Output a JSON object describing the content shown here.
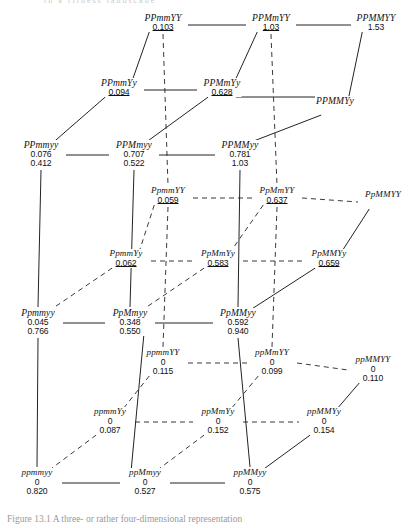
{
  "figure": {
    "caption_top": "in  a  fitness  landscape",
    "caption_bottom": "Figure  13.1     A  three-  or  rather  four-dimensional  representation"
  },
  "chart_data": {
    "type": "diagram",
    "value_label_note": "First number is the upper (underlined) value; second number, when present, is the lower value.",
    "nodes": [
      {
        "id": "PPmmYY",
        "label": "PPmmYY",
        "v1": "0.103",
        "v2": "",
        "underline": true,
        "x": 163,
        "y": 13
      },
      {
        "id": "PPMmYY",
        "label": "PPMmYY",
        "v1": "1.03",
        "v2": "",
        "underline": true,
        "x": 271,
        "y": 13
      },
      {
        "id": "PPMMYY",
        "label": "PPMMYY",
        "v1": "1.53",
        "v2": "",
        "underline": false,
        "x": 376,
        "y": 13
      },
      {
        "id": "PPmmYy",
        "label": "PPmmYy",
        "v1": "0.094",
        "v2": "",
        "underline": true,
        "x": 119,
        "y": 78
      },
      {
        "id": "PPMmYy",
        "label": "PPMmYy",
        "v1": "0.628",
        "v2": "",
        "underline": true,
        "x": 222,
        "y": 78
      },
      {
        "id": "PPMMYy",
        "label": "PPMMYy",
        "v1": "",
        "v2": "",
        "underline": false,
        "x": 335,
        "y": 96
      },
      {
        "id": "PPmmyy",
        "label": "PPmmyy",
        "v1": "0.076",
        "v2": "0.412",
        "underline": false,
        "x": 41,
        "y": 140
      },
      {
        "id": "PPMmyy",
        "label": "PPMmyy",
        "v1": "0.707",
        "v2": "0.522",
        "underline": false,
        "x": 134,
        "y": 140
      },
      {
        "id": "PPMMyy",
        "label": "PPMMyy",
        "v1": "0.781",
        "v2": "1.03",
        "underline": false,
        "x": 240,
        "y": 140
      },
      {
        "id": "PpmmYY",
        "label": "PpmmYY",
        "v1": "0.059",
        "v2": "",
        "underline": true,
        "x": 168,
        "y": 186
      },
      {
        "id": "PpMmYY",
        "label": "PpMmYY",
        "v1": "0.637",
        "v2": "",
        "underline": true,
        "x": 277,
        "y": 186
      },
      {
        "id": "PpMMYY",
        "label": "PpMMYY",
        "v1": "",
        "v2": "",
        "underline": false,
        "x": 383,
        "y": 190
      },
      {
        "id": "PpmmYy",
        "label": "PpmmYy",
        "v1": "0.062",
        "v2": "",
        "underline": true,
        "x": 126,
        "y": 249
      },
      {
        "id": "PpMmYy",
        "label": "PpMmYy",
        "v1": "0.583",
        "v2": "",
        "underline": true,
        "x": 218,
        "y": 249
      },
      {
        "id": "PpMMYy",
        "label": "PpMMYy",
        "v1": "0.659",
        "v2": "",
        "underline": true,
        "x": 329,
        "y": 249
      },
      {
        "id": "Ppmmyy",
        "label": "Ppmmyy",
        "v1": "0.045",
        "v2": "0.766",
        "underline": false,
        "x": 38,
        "y": 308
      },
      {
        "id": "PpMmyy",
        "label": "PpMmyy",
        "v1": "0.348",
        "v2": "0.550",
        "underline": false,
        "x": 130,
        "y": 308
      },
      {
        "id": "PpMMyy",
        "label": "PpMMyy",
        "v1": "0.592",
        "v2": "0.940",
        "underline": false,
        "x": 238,
        "y": 308
      },
      {
        "id": "ppmmYY",
        "label": "ppmmYY",
        "v1": "0",
        "v2": "0.115",
        "underline": false,
        "x": 163,
        "y": 348
      },
      {
        "id": "ppMmYY",
        "label": "ppMmYY",
        "v1": "0",
        "v2": "0.099",
        "underline": false,
        "x": 272,
        "y": 348
      },
      {
        "id": "ppMMYY",
        "label": "ppMMYY",
        "v1": "0",
        "v2": "0.110",
        "underline": false,
        "x": 373,
        "y": 355
      },
      {
        "id": "ppmmYy",
        "label": "ppmmYy",
        "v1": "0",
        "v2": "0.087",
        "underline": false,
        "x": 110,
        "y": 407
      },
      {
        "id": "ppMmYy",
        "label": "ppMmYy",
        "v1": "0",
        "v2": "0.152",
        "underline": false,
        "x": 218,
        "y": 407
      },
      {
        "id": "ppMMYy",
        "label": "ppMMYy",
        "v1": "0",
        "v2": "0.154",
        "underline": false,
        "x": 324,
        "y": 407
      },
      {
        "id": "ppmmyy",
        "label": "ppmmyy",
        "v1": "0",
        "v2": "0.820",
        "underline": false,
        "x": 37,
        "y": 468
      },
      {
        "id": "ppMmyy",
        "label": "ppMmyy",
        "v1": "0",
        "v2": "0.527",
        "underline": false,
        "x": 145,
        "y": 468
      },
      {
        "id": "ppMMyy",
        "label": "ppMMyy",
        "v1": "0",
        "v2": "0.575",
        "underline": false,
        "x": 250,
        "y": 468
      }
    ],
    "edges_solid": [
      [
        "PPmmYY",
        "PPMmYY"
      ],
      [
        "PPMmYY",
        "PPMMYY"
      ],
      [
        "PPmmYy",
        "PPMmYy"
      ],
      [
        "PPMmYy",
        "PPMMYy"
      ],
      [
        "PPmmyy",
        "PPMmyy"
      ],
      [
        "PPMmyy",
        "PPMMyy"
      ],
      [
        "PPmmYY",
        "PPmmYy"
      ],
      [
        "PPMmYY",
        "PPMmYy"
      ],
      [
        "PPMMYY",
        "PPMMYy"
      ],
      [
        "PPmmYy",
        "PPmmyy"
      ],
      [
        "PPMmYy",
        "PPMmyy"
      ],
      [
        "PPMMYy",
        "PPMMyy"
      ],
      [
        "Ppmmyy",
        "PpMmyy"
      ],
      [
        "PpMmyy",
        "PpMMyy"
      ],
      [
        "ppmmyy",
        "ppMmyy"
      ],
      [
        "ppMmyy",
        "ppMMyy"
      ],
      [
        "PpMMYY",
        "PpMMYy"
      ],
      [
        "PpMMYy",
        "PpMMyy"
      ],
      [
        "ppMMYY",
        "ppMMYy"
      ],
      [
        "ppMMYy",
        "ppMMyy"
      ],
      [
        "PPmmyy",
        "Ppmmyy"
      ],
      [
        "PPMmyy",
        "PpMmyy"
      ],
      [
        "PPMMyy",
        "PpMMyy"
      ],
      [
        "Ppmmyy",
        "ppmmyy"
      ],
      [
        "PpMmyy",
        "ppMmyy"
      ],
      [
        "PpMMyy",
        "ppMMyy"
      ]
    ],
    "edges_dashed": [
      [
        "PpmmYY",
        "PpMmYY"
      ],
      [
        "PpMmYY",
        "PpMMYY"
      ],
      [
        "PpmmYy",
        "PpMmYy"
      ],
      [
        "PpMmYy",
        "PpMMYy"
      ],
      [
        "ppmmYY",
        "ppMmYY"
      ],
      [
        "ppMmYY",
        "ppMMYY"
      ],
      [
        "ppmmYy",
        "ppMmYy"
      ],
      [
        "ppMmYy",
        "ppMMYy"
      ],
      [
        "PpmmYY",
        "PpmmYy"
      ],
      [
        "PpMmYY",
        "PpMmYy"
      ],
      [
        "PpmmYy",
        "Ppmmyy"
      ],
      [
        "PpMmYy",
        "PpMmyy"
      ],
      [
        "ppmmYY",
        "ppmmYy"
      ],
      [
        "ppMmYY",
        "ppMmYy"
      ],
      [
        "ppmmYy",
        "ppmmyy"
      ],
      [
        "ppMmYy",
        "ppMmyy"
      ],
      [
        "PPmmYY",
        "PpmmYY"
      ],
      [
        "PPMmYY",
        "PpMmYY"
      ],
      [
        "PpmmYY",
        "ppmmYY"
      ],
      [
        "PpMmYY",
        "ppMmYY"
      ]
    ]
  }
}
